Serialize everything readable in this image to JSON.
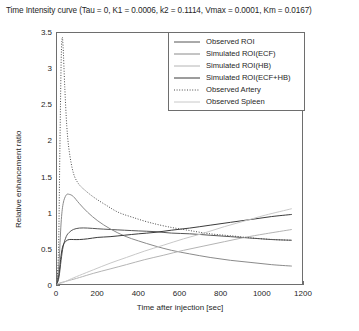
{
  "chart_data": {
    "type": "line",
    "title": "Time Intensity curve (Tau = 0, K1 = 0.0006, k2 = 0.1114, Vmax = 0.0001, Km = 0.0167)",
    "xlabel": "Time after injection [sec]",
    "ylabel": "Relative enhancement ratio",
    "xlim": [
      0,
      1200
    ],
    "ylim": [
      0,
      3.5
    ],
    "xticks": [
      "0",
      "200",
      "400",
      "600",
      "800",
      "1000",
      "1200"
    ],
    "xtick_values": [
      0,
      200,
      400,
      600,
      800,
      1000,
      1200
    ],
    "yticks": [
      "0",
      "0.5",
      "1",
      "1.5",
      "2",
      "2.5",
      "3",
      "3.5"
    ],
    "ytick_values": [
      0,
      0.5,
      1,
      1.5,
      2,
      2.5,
      3,
      3.5
    ],
    "grid": false,
    "legend_position": "top-right",
    "series": [
      {
        "name": "Observed ROI",
        "style": "solid",
        "color": "#555555",
        "x": [
          0,
          10,
          20,
          30,
          45,
          60,
          80,
          110,
          150,
          200,
          260,
          330,
          400,
          480,
          560,
          650,
          750,
          850,
          950,
          1050,
          1150
        ],
        "values": [
          0.0,
          0.1,
          0.33,
          0.52,
          0.66,
          0.72,
          0.76,
          0.78,
          0.78,
          0.77,
          0.76,
          0.75,
          0.74,
          0.73,
          0.71,
          0.7,
          0.68,
          0.66,
          0.64,
          0.62,
          0.61
        ]
      },
      {
        "name": "Simulated ROI(ECF)",
        "style": "solid",
        "color": "#8a8a8a",
        "x": [
          0,
          10,
          20,
          30,
          45,
          60,
          80,
          110,
          150,
          200,
          260,
          330,
          400,
          480,
          560,
          650,
          750,
          850,
          950,
          1050,
          1150
        ],
        "values": [
          0.0,
          0.3,
          0.85,
          1.12,
          1.24,
          1.25,
          1.22,
          1.12,
          1.0,
          0.88,
          0.77,
          0.67,
          0.6,
          0.53,
          0.47,
          0.42,
          0.37,
          0.33,
          0.3,
          0.27,
          0.25
        ]
      },
      {
        "name": "Simulated ROI(HB)",
        "style": "solid",
        "color": "#b4b4b4",
        "x": [
          0,
          20,
          60,
          110,
          180,
          260,
          340,
          430,
          520,
          620,
          720,
          820,
          920,
          1020,
          1150
        ],
        "values": [
          0.0,
          0.02,
          0.05,
          0.09,
          0.15,
          0.21,
          0.27,
          0.34,
          0.4,
          0.47,
          0.53,
          0.59,
          0.65,
          0.7,
          0.76
        ]
      },
      {
        "name": "Simulated ROI(ECF+HB)",
        "style": "solid",
        "color": "#3a3a3a",
        "x": [
          0,
          10,
          20,
          30,
          45,
          60,
          80,
          110,
          150,
          200,
          260,
          330,
          400,
          480,
          560,
          650,
          750,
          850,
          950,
          1050,
          1150
        ],
        "values": [
          0.0,
          0.14,
          0.4,
          0.54,
          0.6,
          0.62,
          0.62,
          0.62,
          0.63,
          0.65,
          0.66,
          0.68,
          0.7,
          0.72,
          0.75,
          0.78,
          0.82,
          0.86,
          0.9,
          0.94,
          0.97
        ]
      },
      {
        "name": "Observed Artery",
        "style": "dotted",
        "color": "#4a4a4a",
        "x": [
          0,
          8,
          14,
          20,
          25,
          30,
          38,
          48,
          60,
          80,
          105,
          140,
          185,
          240,
          300,
          370,
          450,
          540,
          640,
          750,
          860,
          960,
          1060,
          1150
        ],
        "values": [
          0.0,
          0.55,
          1.85,
          3.05,
          3.43,
          3.3,
          2.75,
          2.2,
          1.85,
          1.55,
          1.4,
          1.3,
          1.2,
          1.1,
          1.0,
          0.93,
          0.86,
          0.8,
          0.75,
          0.7,
          0.67,
          0.64,
          0.62,
          0.61
        ]
      },
      {
        "name": "Observed Spleen",
        "style": "solid",
        "color": "#c8c8c8",
        "x": [
          0,
          30,
          60,
          110,
          180,
          260,
          340,
          430,
          520,
          620,
          720,
          820,
          920,
          1020,
          1150
        ],
        "values": [
          0.0,
          0.02,
          0.06,
          0.12,
          0.2,
          0.29,
          0.37,
          0.46,
          0.54,
          0.63,
          0.71,
          0.8,
          0.88,
          0.96,
          1.05
        ]
      }
    ]
  }
}
